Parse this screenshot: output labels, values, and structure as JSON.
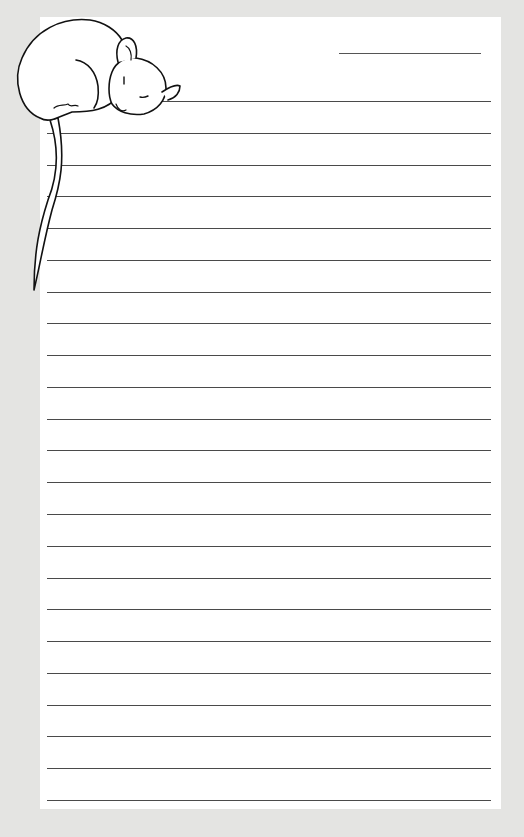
{
  "stationery": {
    "background_color": "#e4e4e2",
    "paper_color": "#ffffff",
    "line_color": "#4a4a4a",
    "illustration": "sleeping-mouse",
    "date_line": {
      "x1": 339,
      "x2": 481,
      "y": 53
    },
    "rules": {
      "count": 23,
      "x_start": 47,
      "x_end": 491,
      "first_y": 101,
      "spacing": 31.77
    }
  }
}
